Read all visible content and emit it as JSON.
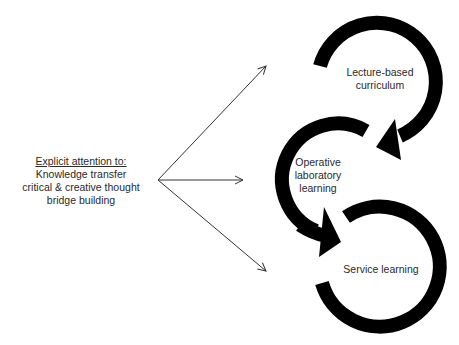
{
  "left_block": {
    "heading": "Explicit attention to:",
    "lines": [
      "Knowledge transfer",
      "critical & creative thought",
      "bridge building"
    ]
  },
  "arrows": [
    {
      "name": "arrow-to-lecture",
      "from": [
        158,
        180
      ],
      "to": [
        266,
        66
      ]
    },
    {
      "name": "arrow-to-operative",
      "from": [
        158,
        180
      ],
      "to": [
        243,
        180
      ]
    },
    {
      "name": "arrow-to-service",
      "from": [
        158,
        180
      ],
      "to": [
        266,
        271
      ]
    }
  ],
  "cycles": [
    {
      "label_lines": [
        "Lecture-based",
        "curriculum"
      ],
      "center": [
        380,
        80
      ]
    },
    {
      "label_lines": [
        "Operative",
        "laboratory",
        "learning"
      ],
      "center": [
        318,
        176
      ]
    },
    {
      "label_lines": [
        "Service learning"
      ],
      "center": [
        381,
        268
      ]
    }
  ],
  "colors": {
    "ring": "#000000",
    "text": "#2a2a2a",
    "line": "#333333"
  }
}
